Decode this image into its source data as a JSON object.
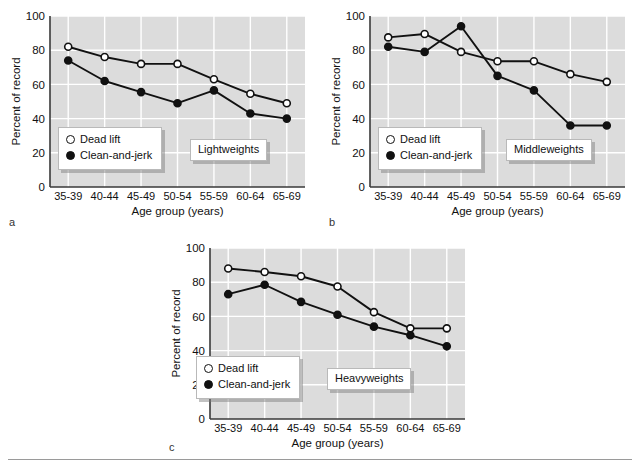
{
  "figure": {
    "bottom_rule": true,
    "background": "#ffffff",
    "plot_background": "#dcdcdc",
    "gridline_color": "#ffffff",
    "series_color": "#111111"
  },
  "axis": {
    "ylabel": "Percent of record",
    "xlabel": "Age group (years)",
    "yticks": [
      "0",
      "20",
      "40",
      "60",
      "80",
      "100"
    ],
    "ymin": 0,
    "ymax": 100,
    "categories": [
      "35-39",
      "40-44",
      "45-49",
      "50-54",
      "55-59",
      "60-64",
      "65-69"
    ]
  },
  "legend": {
    "dead_lift": "Dead lift",
    "clean_and_jerk": "Clean-and-jerk"
  },
  "panels": [
    {
      "letter": "a",
      "annotation": "Lightweights"
    },
    {
      "letter": "b",
      "annotation": "Middleweights"
    },
    {
      "letter": "c",
      "annotation": "Heavyweights"
    }
  ],
  "chart_data": [
    {
      "type": "line",
      "title": "Lightweights",
      "panel": "a",
      "xlabel": "Age group (years)",
      "ylabel": "Percent of record",
      "categories": [
        "35-39",
        "40-44",
        "45-49",
        "50-54",
        "55-59",
        "60-64",
        "65-69"
      ],
      "ylim": [
        0,
        100
      ],
      "yticks": [
        0,
        20,
        40,
        60,
        80,
        100
      ],
      "grid": true,
      "legend_position": "lower-left",
      "series": [
        {
          "name": "Dead lift",
          "marker": "open-circle",
          "values": [
            82,
            76,
            72,
            72,
            63,
            54.5,
            49
          ]
        },
        {
          "name": "Clean-and-jerk",
          "marker": "filled-circle",
          "values": [
            74,
            62,
            55.5,
            49,
            56.5,
            43,
            40
          ]
        }
      ]
    },
    {
      "type": "line",
      "title": "Middleweights",
      "panel": "b",
      "xlabel": "Age group (years)",
      "ylabel": "Percent of record",
      "categories": [
        "35-39",
        "40-44",
        "45-49",
        "50-54",
        "55-59",
        "60-64",
        "65-69"
      ],
      "ylim": [
        0,
        100
      ],
      "yticks": [
        0,
        20,
        40,
        60,
        80,
        100
      ],
      "grid": true,
      "legend_position": "lower-left",
      "series": [
        {
          "name": "Dead lift",
          "marker": "open-circle",
          "values": [
            87.5,
            89.5,
            79,
            73.5,
            73.5,
            66,
            61.5
          ]
        },
        {
          "name": "Clean-and-jerk",
          "marker": "filled-circle",
          "values": [
            82,
            79,
            94,
            65,
            56.5,
            36,
            36
          ]
        }
      ]
    },
    {
      "type": "line",
      "title": "Heavyweights",
      "panel": "c",
      "xlabel": "Age group (years)",
      "ylabel": "Percent of record",
      "categories": [
        "35-39",
        "40-44",
        "45-49",
        "50-54",
        "55-59",
        "60-64",
        "65-69"
      ],
      "ylim": [
        0,
        100
      ],
      "yticks": [
        0,
        20,
        40,
        60,
        80,
        100
      ],
      "grid": true,
      "legend_position": "lower-left",
      "series": [
        {
          "name": "Dead lift",
          "marker": "open-circle",
          "values": [
            88,
            86,
            83.5,
            77.5,
            62.5,
            53,
            53
          ]
        },
        {
          "name": "Clean-and-jerk",
          "marker": "filled-circle",
          "values": [
            73,
            78.5,
            68.5,
            61,
            54,
            49,
            42.5
          ]
        }
      ]
    }
  ]
}
